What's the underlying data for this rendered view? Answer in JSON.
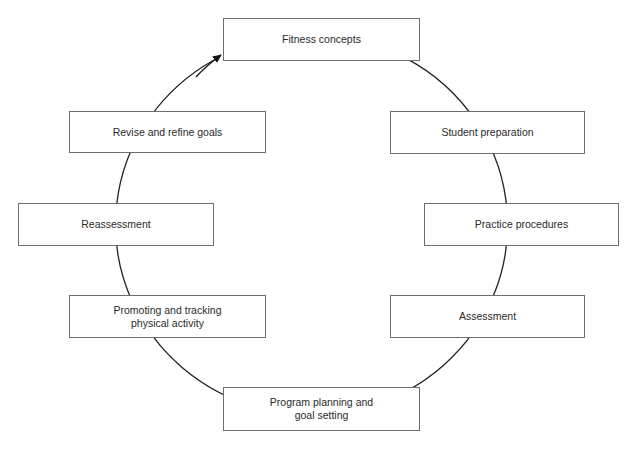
{
  "diagram": {
    "type": "cycle",
    "direction": "clockwise",
    "line_color": "#222222",
    "box_border_color": "#6e6e6e",
    "steps": [
      {
        "id": "fitness-concepts",
        "label": "Fitness concepts",
        "x": 223,
        "y": 18,
        "w": 197,
        "h": 43
      },
      {
        "id": "student-preparation",
        "label": "Student preparation",
        "x": 390,
        "y": 111,
        "w": 195,
        "h": 43
      },
      {
        "id": "practice-procedures",
        "label": "Practice procedures",
        "x": 424,
        "y": 203,
        "w": 195,
        "h": 43
      },
      {
        "id": "assessment",
        "label": "Assessment",
        "x": 390,
        "y": 295,
        "w": 195,
        "h": 43
      },
      {
        "id": "program-planning",
        "label": "Program planning and\ngoal setting",
        "x": 223,
        "y": 387,
        "w": 197,
        "h": 44
      },
      {
        "id": "promoting-tracking",
        "label": "Promoting and tracking\nphysical activity",
        "x": 69,
        "y": 295,
        "w": 197,
        "h": 43
      },
      {
        "id": "reassessment",
        "label": "Reassessment",
        "x": 18,
        "y": 203,
        "w": 196,
        "h": 43
      },
      {
        "id": "revise-refine",
        "label": "Revise and refine goals",
        "x": 69,
        "y": 111,
        "w": 197,
        "h": 42
      }
    ]
  }
}
